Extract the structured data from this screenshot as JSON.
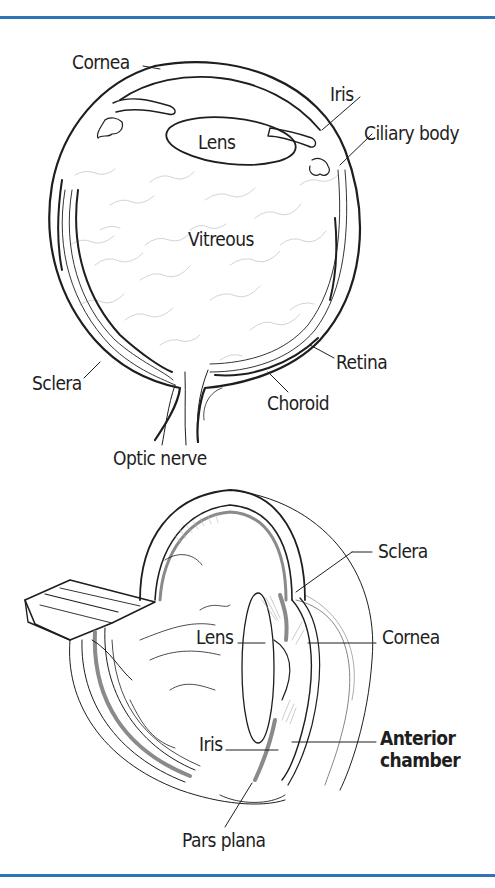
{
  "colors": {
    "rule": "#2f74b5",
    "ink": "#1e1e1e",
    "shade": "#8a8a8a",
    "fiber": "#c8c8c8"
  },
  "top_diagram": {
    "title": "Cross-section of the eye",
    "labels": {
      "cornea": "Cornea",
      "iris": "Iris",
      "ciliary_body": "Ciliary body",
      "lens": "Lens",
      "vitreous": "Vitreous",
      "retina": "Retina",
      "sclera": "Sclera",
      "choroid": "Choroid",
      "optic_nerve": "Optic nerve"
    }
  },
  "bottom_diagram": {
    "title": "Cutaway view of the eye",
    "labels": {
      "sclera": "Sclera",
      "lens": "Lens",
      "cornea": "Cornea",
      "iris": "Iris",
      "anterior_chamber_line1": "Anterior",
      "anterior_chamber_line2": "chamber",
      "pars_plana": "Pars plana"
    }
  }
}
